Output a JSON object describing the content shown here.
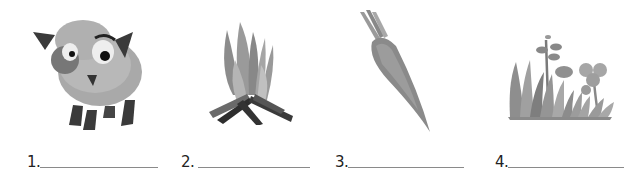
{
  "worksheet": {
    "items": [
      {
        "number": "1.",
        "picture": "sheep",
        "answer": ""
      },
      {
        "number": "2.",
        "picture": "campfire",
        "answer": ""
      },
      {
        "number": "3.",
        "picture": "carrot",
        "answer": ""
      },
      {
        "number": "4.",
        "picture": "grass-and-plants",
        "answer": ""
      }
    ]
  }
}
